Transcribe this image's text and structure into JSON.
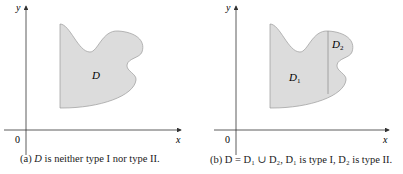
{
  "figure": {
    "panel_a": {
      "axis_y_label": "y",
      "axis_x_label": "x",
      "origin_label": "0",
      "region_label": "D",
      "caption_prefix": "(a) ",
      "caption_var": "D",
      "caption_rest": " is neither type I nor type II."
    },
    "panel_b": {
      "axis_y_label": "y",
      "axis_x_label": "x",
      "origin_label": "0",
      "region1_label": "D",
      "region1_sub": "1",
      "region2_label": "D",
      "region2_sub": "2",
      "caption": "(b) D = D₁ ∪ D₂, D₁ is type I, D₂ is type II."
    },
    "colors": {
      "fill": "#dcdcdc",
      "stroke": "#9a9a9a",
      "axis": "#333333"
    }
  }
}
